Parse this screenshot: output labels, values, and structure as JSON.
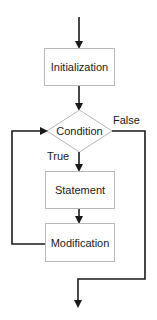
{
  "diagram": {
    "type": "flowchart",
    "colors": {
      "line": "#1a1a1a",
      "box_stroke": "#b8b8b8",
      "box_fill": "#ffffff",
      "text": "#1a1a1a"
    },
    "nodes": [
      {
        "id": "init",
        "shape": "rectangle",
        "label": "Initialization"
      },
      {
        "id": "cond",
        "shape": "diamond",
        "label": "Condition"
      },
      {
        "id": "stmt",
        "shape": "rectangle",
        "label": "Statement"
      },
      {
        "id": "mod",
        "shape": "rectangle",
        "label": "Modification"
      }
    ],
    "edges": [
      {
        "from": "start",
        "to": "init",
        "label": ""
      },
      {
        "from": "init",
        "to": "cond",
        "label": ""
      },
      {
        "from": "cond",
        "to": "stmt",
        "label": "True"
      },
      {
        "from": "stmt",
        "to": "mod",
        "label": ""
      },
      {
        "from": "mod",
        "to": "cond",
        "label": ""
      },
      {
        "from": "cond",
        "to": "end",
        "label": "False"
      }
    ]
  }
}
